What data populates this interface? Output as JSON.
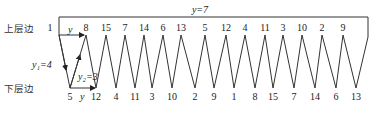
{
  "labels": {
    "upper_edge": "上层边",
    "lower_edge": "下层边",
    "top_span": "y=7",
    "y_top_arrow": "y",
    "y_bottom_arrow": "y",
    "y1": "y₁=4",
    "y2": "y₂=3"
  },
  "top_nodes": [
    "1",
    "8",
    "15",
    "7",
    "14",
    "6",
    "13",
    "5",
    "12",
    "4",
    "11",
    "3",
    "10",
    "2",
    "9"
  ],
  "bottom_nodes": [
    "5",
    "12",
    "4",
    "11",
    "3",
    "10",
    "2",
    "9",
    "1",
    "8",
    "15",
    "7",
    "14",
    "6",
    "13"
  ]
}
